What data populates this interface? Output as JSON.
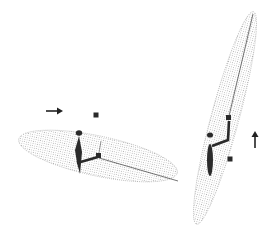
{
  "figure": {
    "width": 278,
    "height": 239,
    "colors": {
      "background": "#ffffff",
      "ellipsoid_dots": "#9a9a9a",
      "body": "#2a2a2a",
      "line": "#3a3a3a",
      "marker": "#2a2a2a"
    },
    "panels": [
      {
        "id": "left",
        "arrow_direction": "right",
        "ellipsoid": {
          "cx": 98,
          "cy": 156,
          "rx": 81,
          "ry": 20,
          "rotation_deg": 12
        },
        "arrow": {
          "x1": 46,
          "y1": 111,
          "x2": 62,
          "y2": 111
        },
        "marker": {
          "x": 96,
          "y": 115,
          "size": 5
        }
      },
      {
        "id": "right",
        "arrow_direction": "up",
        "ellipsoid": {
          "cx": 225,
          "cy": 118,
          "rx": 110,
          "ry": 14,
          "rotation_deg": -75
        },
        "arrow": {
          "x1": 255,
          "y1": 148,
          "x2": 255,
          "y2": 131
        },
        "marker": {
          "x": 230,
          "y": 159,
          "size": 5
        }
      }
    ]
  }
}
